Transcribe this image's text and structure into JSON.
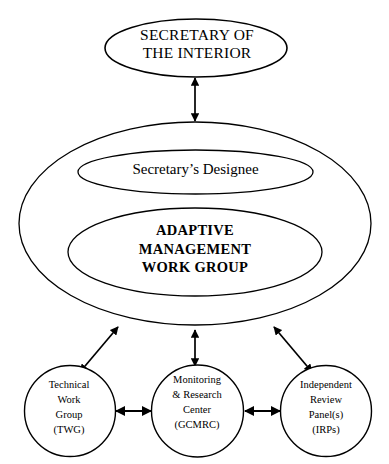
{
  "diagram": {
    "background_color": "#ffffff",
    "line_color": "#000000",
    "nodes": {
      "secretary": {
        "label": "SECRETARY OF\nTHE INTERIOR",
        "shape": "ellipse"
      },
      "designee": {
        "label": "Secretary’s Designee",
        "shape": "ellipse"
      },
      "amwg": {
        "label": "ADAPTIVE\nMANAGEMENT\nWORK GROUP",
        "shape": "ellipse"
      },
      "container": {
        "label": "",
        "shape": "ellipse"
      },
      "twg": {
        "label": "Technical\nWork\nGroup\n(TWG)",
        "shape": "circle"
      },
      "gcmrc": {
        "label": "Monitoring\n& Research\nCenter\n(GCMRC)",
        "shape": "circle"
      },
      "irps": {
        "label": "Independent\nReview\nPanel(s)\n(IRPs)",
        "shape": "circle"
      }
    },
    "connectors": [
      {
        "name": "secretary-to-container",
        "from": "secretary",
        "to": "container",
        "style": "double-arrow"
      },
      {
        "name": "designee-to-amwg",
        "from": "designee",
        "to": "amwg",
        "style": "plain-line"
      },
      {
        "name": "amwg-to-container-bottom",
        "from": "amwg",
        "to": "container",
        "style": "single-arrow-down"
      },
      {
        "name": "container-to-gcmrc",
        "from": "container",
        "to": "gcmrc",
        "style": "double-arrow"
      },
      {
        "name": "container-to-twg",
        "from": "container",
        "to": "twg",
        "style": "double-arrow"
      },
      {
        "name": "container-to-irps",
        "from": "container",
        "to": "irps",
        "style": "double-arrow"
      },
      {
        "name": "twg-to-gcmrc",
        "from": "twg",
        "to": "gcmrc",
        "style": "double-arrow"
      },
      {
        "name": "gcmrc-to-irps",
        "from": "gcmrc",
        "to": "irps",
        "style": "double-arrow"
      }
    ]
  }
}
